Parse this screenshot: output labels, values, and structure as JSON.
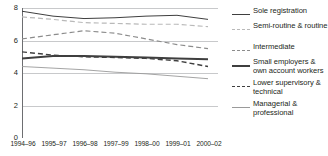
{
  "chart_data": {
    "type": "line",
    "title": "",
    "subtitle": "",
    "xlabel": "",
    "ylabel": "",
    "categories": [
      "1994–96",
      "1995–97",
      "1996–98",
      "1997–99",
      "1998–00",
      "1999–01",
      "2000–02"
    ],
    "ylim": [
      0,
      8
    ],
    "yticks": [
      0,
      2,
      4,
      6,
      8
    ],
    "ytick_labels": [
      "0",
      "2",
      "4",
      "6",
      "8"
    ],
    "grid": true,
    "grid_axis": "y",
    "legend_position": "right",
    "series": [
      {
        "name": "Sole registration",
        "values": [
          7.8,
          7.5,
          7.35,
          7.4,
          7.5,
          7.55,
          7.3
        ],
        "color": "#3f3f3f",
        "style": "solid",
        "width": 1.0
      },
      {
        "name": "Semi-routine & routine",
        "values": [
          7.45,
          7.3,
          7.1,
          7.05,
          7.0,
          7.0,
          6.85
        ],
        "color": "#b9b9b9",
        "style": "dashed",
        "width": 1.2
      },
      {
        "name": "Intermediate",
        "values": [
          6.1,
          6.35,
          6.6,
          6.45,
          6.1,
          5.75,
          5.5
        ],
        "color": "#8c8c8c",
        "style": "dashed",
        "width": 1.2
      },
      {
        "name": "Small employers & own account workers",
        "values": [
          4.9,
          5.05,
          5.05,
          5.0,
          4.95,
          4.9,
          4.85
        ],
        "color": "#3f3f3f",
        "style": "solid",
        "width": 2.0
      },
      {
        "name": "Lower supervisory & technical",
        "values": [
          5.3,
          5.1,
          5.0,
          4.95,
          4.9,
          4.75,
          4.4
        ],
        "color": "#3f3f3f",
        "style": "dashed",
        "width": 1.4
      },
      {
        "name": "Managerial & professional",
        "values": [
          4.4,
          4.3,
          4.2,
          4.05,
          3.95,
          3.8,
          3.65
        ],
        "color": "#9a9a9a",
        "style": "solid",
        "width": 0.9
      }
    ]
  },
  "axis": {
    "y_tick_labels": [
      "8",
      "6",
      "4",
      "2",
      "0"
    ],
    "x_tick_labels": [
      "1994–96",
      "1995–97",
      "1996–98",
      "1997–99",
      "1998–00",
      "1999–01",
      "2000–02"
    ]
  },
  "legend": {
    "items": [
      {
        "label": "Sole registration"
      },
      {
        "label": "Semi-routine & routine"
      },
      {
        "label": "Intermediate"
      },
      {
        "label": "Small employers & own account workers"
      },
      {
        "label": "Lower supervisory & technical"
      },
      {
        "label": "Managerial & professional"
      }
    ]
  },
  "colors": {
    "axis": "#6d6e71",
    "grid": "#c8c9cb",
    "text": "#231f20",
    "background": "#ffffff"
  }
}
